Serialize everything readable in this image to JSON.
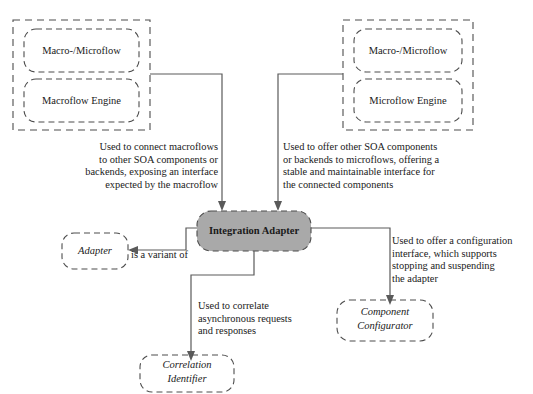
{
  "diagram": {
    "groups": [
      {
        "name": "left-flow-group",
        "members": [
          {
            "label": "Macro-/Microflow"
          },
          {
            "label": "Macroflow Engine"
          }
        ]
      },
      {
        "name": "right-flow-group",
        "members": [
          {
            "label": "Macro-/Microflow"
          },
          {
            "label": "Microflow Engine"
          }
        ]
      }
    ],
    "center_node": {
      "label": "Integration Adapter",
      "fill": "#a9a9a9",
      "stroke": "#4d4d4d"
    },
    "pattern_nodes": [
      {
        "name": "adapter",
        "label": "Adapter"
      },
      {
        "name": "correlation-identifier",
        "label": "Correlation\nIdentifier"
      },
      {
        "name": "component-configurator",
        "label": "Component\nConfigurator"
      }
    ],
    "annotations": {
      "left": "Used to connect macroflows\nto other SOA components or\nbackends, exposing an interface\nexpected by the macroflow",
      "right": "Used to offer other SOA components\nor backends to microflows, offering a\nstable and maintainable interface for\nthe connected components",
      "correlation": "Used to correlate\nasynchronous requests\nand responses",
      "configurator": "Used to offer a configuration\ninterface, which supports\nstopping and suspending\nthe adapter",
      "variant": "is a variant of"
    }
  }
}
